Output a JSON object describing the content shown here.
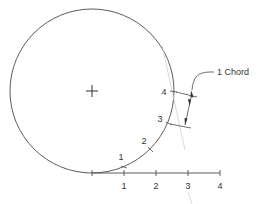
{
  "diagram": {
    "callout": {
      "label": "1 Chord"
    },
    "circle_marks": [
      {
        "label": "1"
      },
      {
        "label": "2"
      },
      {
        "label": "3"
      },
      {
        "label": "4"
      }
    ],
    "baseline_ticks": [
      {
        "label": "1"
      },
      {
        "label": "2"
      },
      {
        "label": "3"
      },
      {
        "label": "4"
      }
    ],
    "center_mark": "+",
    "colors": {
      "line": "#4a4a4a",
      "faint_line": "#c8c8c8",
      "text": "#333333"
    }
  }
}
